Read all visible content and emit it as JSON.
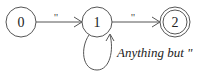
{
  "diagram": {
    "type": "finite-state-automaton",
    "colors": {
      "stroke": "#555555",
      "text": "#222222",
      "background": "#ffffff"
    },
    "states": [
      {
        "id": "0",
        "label": "0",
        "accepting": false
      },
      {
        "id": "1",
        "label": "1",
        "accepting": false
      },
      {
        "id": "2",
        "label": "2",
        "accepting": true
      }
    ],
    "transitions": [
      {
        "from": "0",
        "to": "1",
        "label": "\""
      },
      {
        "from": "1",
        "to": "2",
        "label": "\""
      },
      {
        "from": "1",
        "to": "1",
        "label": "Anything but \""
      }
    ]
  }
}
